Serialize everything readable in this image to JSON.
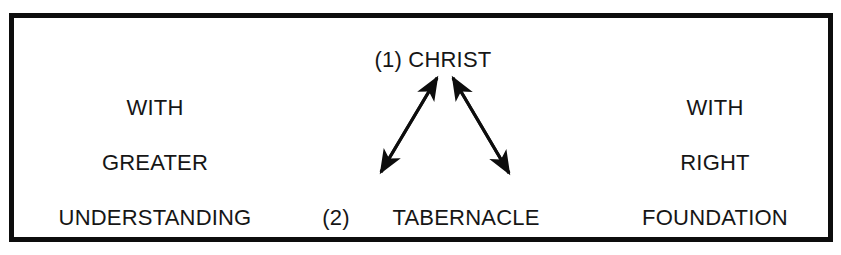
{
  "diagram": {
    "frame": {
      "border_color": "#0d0d0d",
      "background_color": "#ffffff"
    },
    "text_color": "#161616",
    "left_column": {
      "line1": "WITH",
      "line2": "GREATER",
      "line3": "UNDERSTANDING"
    },
    "center_column": {
      "top_marker": "(1)",
      "top_label": "CHRIST",
      "top_combined": "(1)  CHRIST",
      "bottom_marker": "(2)",
      "bottom_label": "TABERNACLE"
    },
    "right_column": {
      "line1": "WITH",
      "line2": "RIGHT",
      "line3": "FOUNDATION"
    },
    "arrows": [
      {
        "name": "left-double-arrow",
        "from": "TABERNACLE",
        "to": "CHRIST",
        "heads": "both",
        "color": "#0d0d0d"
      },
      {
        "name": "right-double-arrow",
        "from": "TABERNACLE",
        "to": "CHRIST",
        "heads": "both",
        "color": "#0d0d0d"
      }
    ]
  }
}
